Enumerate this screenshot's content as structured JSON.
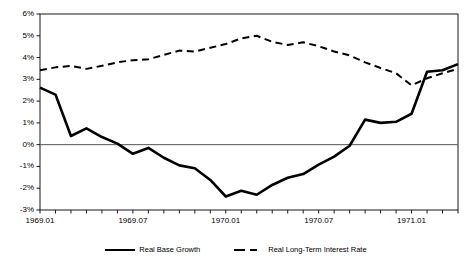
{
  "chart_data": {
    "type": "line",
    "title": "",
    "xlabel": "",
    "ylabel": "",
    "ylim": [
      -3,
      6
    ],
    "ytick_labels": [
      "6%",
      "5%",
      "4%",
      "3%",
      "2%",
      "1%",
      "0%",
      "-1%",
      "-2%",
      "-3%"
    ],
    "ytick_values": [
      6,
      5,
      4,
      3,
      2,
      1,
      0,
      -1,
      -2,
      -3
    ],
    "grid": false,
    "zero_line": true,
    "legend_position": "bottom",
    "x": [
      "1969.01",
      "1969.02",
      "1969.03",
      "1969.04",
      "1969.05",
      "1969.06",
      "1969.07",
      "1969.08",
      "1969.09",
      "1969.10",
      "1969.11",
      "1969.12",
      "1970.01",
      "1970.02",
      "1970.03",
      "1970.04",
      "1970.05",
      "1970.06",
      "1970.07",
      "1970.08",
      "1970.09",
      "1970.10",
      "1970.11",
      "1970.12",
      "1971.01",
      "1971.02",
      "1971.03",
      "1971.04"
    ],
    "xtick_labels": [
      "1969.01",
      "1969.07",
      "1970.01",
      "1970.07",
      "1971.01"
    ],
    "xtick_indices": [
      0,
      6,
      12,
      18,
      24
    ],
    "series": [
      {
        "name": "Real Base Growth",
        "style": "solid",
        "color": "#000000",
        "width": 2.6,
        "values": [
          2.62,
          2.3,
          0.4,
          0.75,
          0.35,
          0.05,
          -0.42,
          -0.15,
          -0.6,
          -0.95,
          -1.08,
          -1.62,
          -2.38,
          -2.12,
          -2.3,
          -1.85,
          -1.52,
          -1.35,
          -0.92,
          -0.55,
          -0.05,
          1.15,
          1.0,
          1.05,
          1.42,
          3.35,
          3.42,
          3.7
        ]
      },
      {
        "name": "Real Long-Term Interest Rate",
        "style": "dashed",
        "color": "#000000",
        "width": 2.0,
        "values": [
          3.42,
          3.55,
          3.62,
          3.48,
          3.62,
          3.78,
          3.88,
          3.92,
          4.12,
          4.32,
          4.28,
          4.45,
          4.62,
          4.88,
          5.0,
          4.72,
          4.58,
          4.7,
          4.52,
          4.28,
          4.1,
          3.78,
          3.52,
          3.28,
          2.72,
          3.05,
          3.28,
          3.48
        ]
      }
    ]
  },
  "legend": {
    "entries": [
      {
        "label": "Real Base Growth",
        "swatch": "solid-line-swatch"
      },
      {
        "label": "Real Long-Term Interest Rate",
        "swatch": "dashed-line-swatch"
      }
    ]
  }
}
